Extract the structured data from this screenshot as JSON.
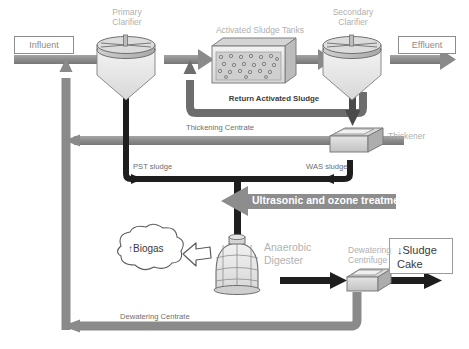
{
  "diagram": {
    "background_color": "#ffffff",
    "colors": {
      "equipment_label": "#b0b0b0",
      "stream_label": "#8f8f8f",
      "water_pipe": "#8a8a8a",
      "sludge_pipe": "#1c1c1c",
      "banner_fill": "#8d8d8d",
      "banner_text": "#ffffff",
      "box_border": "#8c8c8c",
      "tank_fill": "#e9e9e9"
    }
  },
  "io_boxes": {
    "influent": "Influent",
    "effluent": "Effluent",
    "sludge_cake": "↓Sludge\nCake"
  },
  "equipment": [
    {
      "id": "primary-clarifier",
      "label": "Primary\nClarifier"
    },
    {
      "id": "activated-sludge-tanks",
      "label": "Activated Sludge Tanks"
    },
    {
      "id": "secondary-clarifier",
      "label": "Secondary\nClarifier"
    },
    {
      "id": "thickener",
      "label": "Thickener"
    },
    {
      "id": "anaerobic-digester",
      "label": "Anaerobic\nDigester"
    },
    {
      "id": "dewatering-centrifuge",
      "label": "Dewatering\nCentrifuge"
    }
  ],
  "streams": [
    {
      "id": "return-activated-sludge",
      "label": "Return Activated Sludge"
    },
    {
      "id": "thickening-centrate",
      "label": "Thickening Centrate"
    },
    {
      "id": "pst-sludge",
      "label": "PST sludge"
    },
    {
      "id": "was-sludge",
      "label": "WAS sludge"
    },
    {
      "id": "dewatering-centrate",
      "label": "Dewatering Centrate"
    }
  ],
  "annotations": {
    "treatment_banner": "Ultrasonic and ozone treatment",
    "biogas": "↑Biogas"
  }
}
